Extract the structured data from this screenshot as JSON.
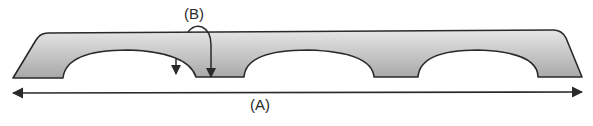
{
  "diagram": {
    "type": "arched beam schematic",
    "labels": {
      "a": "(A)",
      "b": "(B)"
    },
    "elements": [
      {
        "id": "beam",
        "description": "Gray tapered beam with three semicircular arch cutouts"
      },
      {
        "id": "dimension-arrow-a",
        "description": "Double-headed horizontal arrow spanning full beam length",
        "label": "(A)"
      },
      {
        "id": "curved-arrow-b",
        "description": "Curved arrow from top edge down to pillar base",
        "label": "(B)"
      },
      {
        "id": "small-down-arrow",
        "description": "Short downward arrow from first arch"
      }
    ],
    "colors": {
      "fill_light": "#e4e4e4",
      "fill_dark": "#a9a9a9",
      "stroke": "#2a2a2a"
    }
  }
}
